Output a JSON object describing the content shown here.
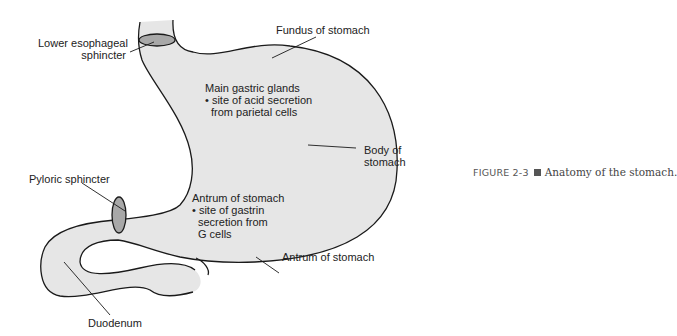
{
  "figure": {
    "caption_label": "FIGURE 2-3",
    "caption_text": "Anatomy of the stomach.",
    "colors": {
      "fill": "#e6e6e6",
      "outline": "#1a1a1a",
      "sphincter": "#a8a8a8",
      "text": "#222222"
    }
  },
  "labels": {
    "lower_esophageal_line1": "Lower esophageal",
    "lower_esophageal_line2": "sphincter",
    "fundus": "Fundus of stomach",
    "main_glands_title": "Main gastric glands",
    "main_glands_line2": "• site of acid secretion",
    "main_glands_line3": "from parietal cells",
    "body_line1": "Body of",
    "body_line2": "stomach",
    "pyloric": "Pyloric sphincter",
    "antrum_inner_title": "Antrum of stomach",
    "antrum_inner_line2": "• site of gastrin",
    "antrum_inner_line3": "secretion from",
    "antrum_inner_line4": "G cells",
    "antrum_outer": "Antrum of stomach",
    "duodenum": "Duodenum"
  }
}
